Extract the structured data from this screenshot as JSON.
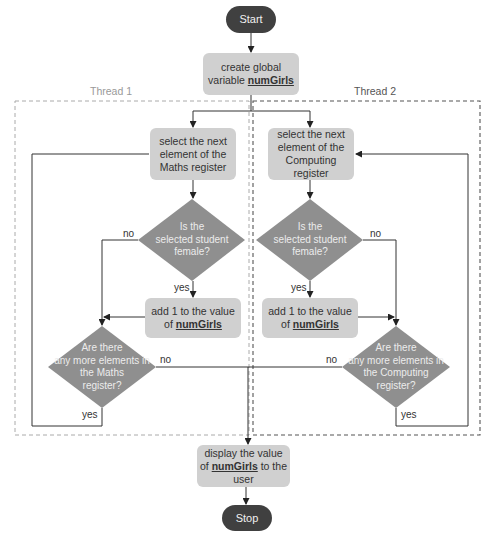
{
  "nodes": {
    "start": "Start",
    "create": {
      "line1": "create global",
      "line2_prefix": "variable ",
      "var": "numGirls"
    },
    "select_maths": {
      "line1": "select the next",
      "line2": "element of the",
      "line3": "Maths register"
    },
    "select_computing": {
      "line1": "select the next",
      "line2": "element of the",
      "line3": "Computing register"
    },
    "female_left": {
      "line1": "Is the",
      "line2": "selected student",
      "line3": "female?"
    },
    "female_right": {
      "line1": "Is the",
      "line2": "selected student",
      "line3": "female?"
    },
    "add_left": {
      "line1": "add 1 to the value",
      "line2_prefix": "of ",
      "var": "numGirls"
    },
    "add_right": {
      "line1": "add 1 to the value",
      "line2_prefix": "of ",
      "var": "numGirls"
    },
    "more_maths": {
      "line1": "Are there",
      "line2": "any more elements in",
      "line3": "the Maths",
      "line4": "register?"
    },
    "more_computing": {
      "line1": "Are there",
      "line2": "any more elements in",
      "line3": "the Computing",
      "line4": "register?"
    },
    "display": {
      "line1": "display the value",
      "line2_prefix": "of ",
      "var": "numGirls",
      "line2_suffix": " to the user"
    },
    "stop": "Stop"
  },
  "threads": {
    "t1": "Thread 1",
    "t2": "Thread 2"
  },
  "edges": {
    "left_no": "no",
    "left_yes": "yes",
    "right_no": "no",
    "right_yes": "yes",
    "maths_no": "no",
    "maths_yes": "yes",
    "comp_no": "no",
    "comp_yes": "yes"
  },
  "colors": {
    "terminal": "#404040",
    "process": "#d0d0d0",
    "decision": "#8f8f8f",
    "line": "#333333"
  }
}
